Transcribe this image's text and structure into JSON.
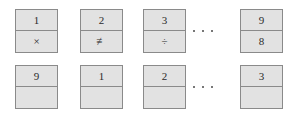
{
  "diagram": {
    "colors": {
      "background": "#ffffff",
      "card_fill": "#e2e2e2",
      "card_border": "#8a8a8a",
      "text": "#2b2b2b",
      "dot": "#4a4a4a"
    },
    "rows": [
      {
        "name": "top-row",
        "cards": [
          {
            "top": "1",
            "bottom": "×",
            "bottom_icon": "multiplication-sign"
          },
          {
            "top": "2",
            "bottom": "≢",
            "bottom_icon": "not-identical-to-sign"
          },
          {
            "top": "3",
            "bottom": "÷",
            "bottom_icon": "division-sign"
          },
          {
            "top": "9",
            "bottom": "8",
            "bottom_icon": "digit"
          }
        ],
        "ellipsis": {
          "dots": 3,
          "label": "..."
        }
      },
      {
        "name": "bottom-row",
        "cards": [
          {
            "top": "9",
            "bottom": "",
            "bottom_icon": "empty-cell"
          },
          {
            "top": "1",
            "bottom": "",
            "bottom_icon": "empty-cell"
          },
          {
            "top": "2",
            "bottom": "",
            "bottom_icon": "empty-cell"
          },
          {
            "top": "3",
            "bottom": "",
            "bottom_icon": "empty-cell"
          }
        ],
        "ellipsis": {
          "dots": 3,
          "label": "..."
        }
      }
    ]
  }
}
